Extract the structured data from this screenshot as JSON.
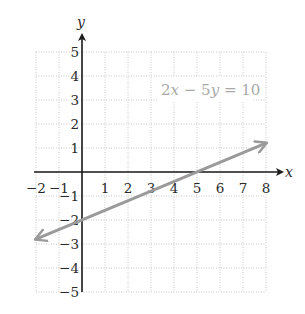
{
  "chart_data": {
    "type": "line",
    "title": "",
    "xlabel": "x",
    "ylabel": "y",
    "xlim": [
      -2,
      8
    ],
    "ylim": [
      -5,
      5
    ],
    "grid": true,
    "grid_style": "dotted",
    "x_ticks": [
      -2,
      -1,
      1,
      2,
      3,
      4,
      5,
      6,
      7,
      8
    ],
    "y_ticks": [
      5,
      4,
      3,
      2,
      1,
      -1,
      -2,
      -3,
      -4,
      -5
    ],
    "x_tick_labels": [
      "−2",
      "−1",
      "1",
      "2",
      "3",
      "4",
      "5",
      "6",
      "7",
      "8"
    ],
    "y_tick_labels": [
      "5",
      "4",
      "3",
      "2",
      "1",
      "−1",
      "−2",
      "−3",
      "−4",
      "−5"
    ],
    "series": [
      {
        "name": "2x − 5y = 10",
        "equation": "2x - 5y = 10",
        "x": [
          -2,
          0,
          5,
          8
        ],
        "y": [
          -2.8,
          -2,
          0,
          1.2
        ],
        "arrows": "both",
        "color": "#9a9a9a"
      }
    ],
    "annotations": [
      {
        "text": "2x − 5y = 10",
        "x": 5,
        "y": 3.5
      }
    ],
    "intercepts": {
      "x_intercept": [
        5,
        0
      ],
      "y_intercept": [
        0,
        -2
      ]
    }
  },
  "labels": {
    "x_axis": "x",
    "y_axis": "y",
    "equation_parts": {
      "a": "2",
      "v1": "x",
      "op": " − 5",
      "v2": "y",
      "rhs": " = 10"
    }
  },
  "colors": {
    "line": "#9a9a9a",
    "grid": "#c8c8c8",
    "axis": "#1a1a1a",
    "equation": "#a9a9a9"
  }
}
